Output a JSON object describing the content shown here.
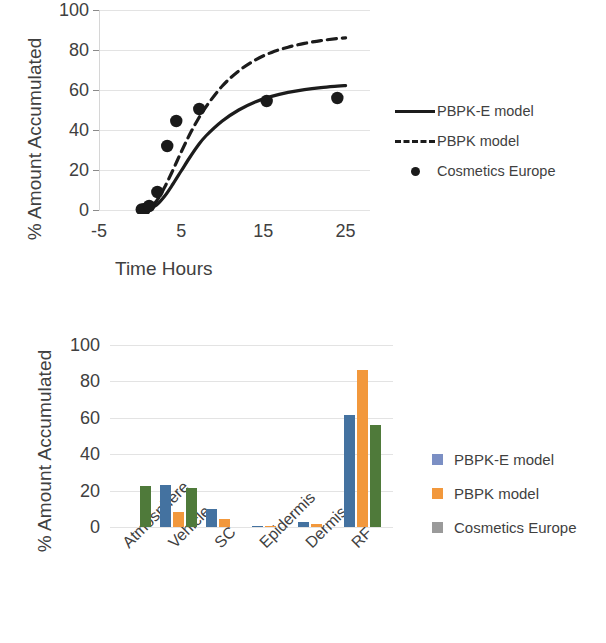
{
  "chart_data": [
    {
      "type": "line",
      "title": "",
      "xlabel": "Time Hours",
      "ylabel": "% Amount Accumulated",
      "xlim": [
        -5,
        27
      ],
      "ylim": [
        0,
        100
      ],
      "xticks": [
        -5,
        5,
        15,
        25
      ],
      "xtick_labels": [
        "-5",
        "5",
        "15",
        "25"
      ],
      "yticks": [
        0,
        20,
        40,
        60,
        80,
        100
      ],
      "ytick_labels": [
        "0",
        "20",
        "40",
        "60",
        "80",
        "100"
      ],
      "grid": true,
      "legend_position": "right",
      "series": [
        {
          "name": "PBPK-E model",
          "style": "solid",
          "color": "#1c1c1c",
          "x": [
            0,
            1,
            2,
            3,
            4,
            5,
            6,
            7,
            8,
            10,
            12,
            14,
            16,
            18,
            20,
            22,
            24,
            25
          ],
          "y": [
            0,
            0.4,
            2.5,
            7,
            13,
            19.5,
            26,
            32,
            37,
            44.5,
            50,
            54,
            56.8,
            58.8,
            60.2,
            61.2,
            61.9,
            62.2
          ]
        },
        {
          "name": "PBPK model",
          "style": "dashed",
          "color": "#1c1c1c",
          "x": [
            0,
            1,
            2,
            3,
            4,
            5,
            6,
            7,
            8,
            10,
            12,
            14,
            16,
            18,
            20,
            22,
            24,
            25
          ],
          "y": [
            0,
            0.8,
            4.5,
            11.5,
            20,
            29,
            37.5,
            45,
            51.5,
            62,
            69.5,
            75,
            78.8,
            81.4,
            83.3,
            84.7,
            85.7,
            86.1
          ]
        },
        {
          "name": "Cosmetics Europe",
          "style": "scatter",
          "color": "#1a1a1a",
          "x": [
            0.2,
            0.6,
            1.1,
            2.1,
            3.3,
            4.4,
            7.2,
            15.4,
            24.0
          ],
          "y": [
            0.3,
            0.5,
            2.0,
            9.0,
            32.0,
            44.5,
            50.5,
            54.5,
            56.0
          ]
        }
      ]
    },
    {
      "type": "bar",
      "title": "",
      "xlabel": "",
      "ylabel": "% Amount Accumulated",
      "categories": [
        "Atmosphere",
        "Vehicle",
        "SC",
        "Epidermis",
        "Dermis",
        "RF"
      ],
      "yticks": [
        0,
        20,
        40,
        60,
        80,
        100
      ],
      "ytick_labels": [
        "0",
        "20",
        "40",
        "60",
        "80",
        "100"
      ],
      "ylim": [
        0,
        100
      ],
      "grid": true,
      "legend_position": "right",
      "series": [
        {
          "name": "PBPK-E model",
          "color": "#4472a0",
          "values": [
            0,
            23.2,
            10.0,
            0.6,
            2.6,
            61.8
          ]
        },
        {
          "name": "PBPK model",
          "color": "#f2983c",
          "values": [
            0,
            8.0,
            4.2,
            0.5,
            1.6,
            86.0
          ]
        },
        {
          "name": "Cosmetics Europe",
          "color": "#4f7a3a",
          "legend_swatch_color": "#9a9a9a",
          "values": [
            22.5,
            21.3,
            0,
            0,
            0,
            55.8
          ]
        }
      ]
    }
  ]
}
